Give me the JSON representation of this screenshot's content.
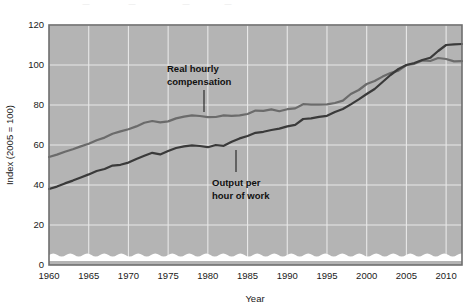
{
  "figure": {
    "plot_bg_color": "#b4b4b4",
    "grid_color": "#e8e8e8",
    "frame_color": "#6e6e6e",
    "axis_break_color": "#ffffff"
  },
  "axes": {
    "y": {
      "title": "Index (2005 = 100)",
      "ticks": [
        0,
        20,
        40,
        60,
        80,
        100,
        120
      ],
      "tick_labels": [
        "0",
        "20",
        "40",
        "60",
        "80",
        "100",
        "120"
      ],
      "min": 0,
      "max": 120
    },
    "x": {
      "title": "Year",
      "ticks": [
        1960,
        1965,
        1970,
        1975,
        1980,
        1985,
        1990,
        1995,
        2000,
        2005,
        2010
      ],
      "tick_labels": [
        "1960",
        "1965",
        "1970",
        "1975",
        "1980",
        "1985",
        "1990",
        "1995",
        "2000",
        "2005",
        "2010"
      ],
      "min": 1960,
      "max": 2012
    }
  },
  "annotations": [
    {
      "id": "real-hourly-compensation",
      "line1": "Real hourly",
      "line2": "compensation",
      "color": "#111111"
    },
    {
      "id": "output-per-hour-of-work",
      "line1": "Output per",
      "line2": "hour of work",
      "color": "#111111"
    }
  ],
  "chart_data": {
    "type": "line",
    "title": "",
    "subtitle": "",
    "xlabel": "Year",
    "ylabel": "Index (2005 = 100)",
    "xlim": [
      1960,
      2012
    ],
    "ylim": [
      0,
      120
    ],
    "grid": true,
    "legend": "inline-annotations",
    "x": [
      1960,
      1961,
      1962,
      1963,
      1964,
      1965,
      1966,
      1967,
      1968,
      1969,
      1970,
      1971,
      1972,
      1973,
      1974,
      1975,
      1976,
      1977,
      1978,
      1979,
      1980,
      1981,
      1982,
      1983,
      1984,
      1985,
      1986,
      1987,
      1988,
      1989,
      1990,
      1991,
      1992,
      1993,
      1994,
      1995,
      1996,
      1997,
      1998,
      1999,
      2000,
      2001,
      2002,
      2003,
      2004,
      2005,
      2006,
      2007,
      2008,
      2009,
      2010,
      2011,
      2012
    ],
    "series": [
      {
        "name": "Real hourly compensation",
        "color": "#6b6b6b",
        "values": [
          54.0,
          55.2,
          56.6,
          57.9,
          59.3,
          60.6,
          62.4,
          63.7,
          65.6,
          66.8,
          67.9,
          69.3,
          71.1,
          72.0,
          71.3,
          71.8,
          73.3,
          74.2,
          74.8,
          74.5,
          73.9,
          74.0,
          74.8,
          74.6,
          74.8,
          75.5,
          77.2,
          77.1,
          77.8,
          76.9,
          77.9,
          78.3,
          80.4,
          80.2,
          80.2,
          80.3,
          81.0,
          82.2,
          85.5,
          87.5,
          90.5,
          92.0,
          94.2,
          96.0,
          97.2,
          100.0,
          100.6,
          102.3,
          102.0,
          103.5,
          103.0,
          101.8,
          101.9
        ]
      },
      {
        "name": "Output per hour of work",
        "color": "#3a3a3a",
        "values": [
          38.0,
          39.2,
          40.8,
          42.2,
          43.8,
          45.3,
          47.0,
          48.0,
          49.7,
          50.1,
          51.2,
          53.0,
          54.6,
          56.1,
          55.3,
          57.0,
          58.5,
          59.3,
          59.8,
          59.5,
          58.9,
          60.0,
          59.6,
          61.6,
          63.3,
          64.5,
          66.1,
          66.6,
          67.5,
          68.2,
          69.3,
          70.1,
          73.0,
          73.3,
          74.1,
          74.6,
          76.5,
          78.0,
          80.3,
          82.8,
          85.5,
          88.0,
          91.5,
          95.0,
          98.0,
          100.0,
          101.0,
          102.5,
          103.6,
          107.0,
          110.0,
          110.3,
          110.5
        ]
      }
    ]
  }
}
